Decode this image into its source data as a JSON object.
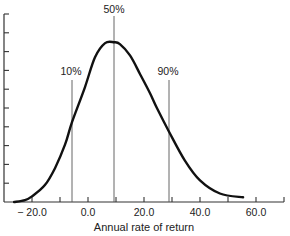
{
  "chart_data": {
    "type": "line",
    "title": "",
    "xlabel": "Annual rate of return",
    "ylabel": "",
    "xlim": [
      -26,
      72
    ],
    "ylim": [
      0,
      10
    ],
    "grid": false,
    "legend": null,
    "x_ticks": [
      -20,
      -10,
      0,
      10,
      20,
      30,
      40,
      50,
      60,
      70
    ],
    "x_tick_labels": [
      "− 20.0",
      "0.0",
      "20.0",
      "40.0",
      "60.0"
    ],
    "x_tick_label_values": [
      -20,
      0,
      20,
      40,
      60
    ],
    "y_ticks": [
      0,
      1,
      2,
      3,
      4,
      5,
      6,
      7,
      8,
      9,
      10
    ],
    "y_tick_labels": [],
    "series": [
      {
        "name": "Probability distribution of annual rate of return",
        "x": [
          -26.4,
          -22.5,
          -20.0,
          -15.4,
          -11.8,
          -8.2,
          -5.7,
          -1.1,
          2.5,
          6.1,
          9.3,
          11.4,
          15.0,
          18.6,
          22.1,
          24.6,
          28.9,
          34.6,
          40.0,
          47.1,
          55.4
        ],
        "y": [
          0.0,
          0.1,
          0.3,
          0.9,
          1.8,
          3.05,
          4.25,
          6.1,
          7.7,
          8.45,
          8.5,
          8.4,
          7.8,
          6.8,
          5.8,
          5.0,
          3.75,
          2.2,
          1.15,
          0.45,
          0.25
        ]
      }
    ],
    "annotations": [
      {
        "label": "10%",
        "x": -5.7,
        "type": "percentile-line"
      },
      {
        "label": "50%",
        "x": 9.3,
        "type": "percentile-line"
      },
      {
        "label": "90%",
        "x": 28.9,
        "type": "percentile-line"
      }
    ]
  },
  "labels": {
    "p10": "10%",
    "p50": "50%",
    "p90": "90%",
    "xaxis_title": "Annual rate of return",
    "xticks": [
      "− 20.0",
      "0.0",
      "20.0",
      "40.0",
      "60.0"
    ]
  }
}
